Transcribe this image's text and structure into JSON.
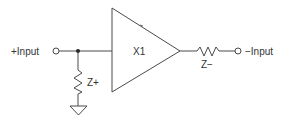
{
  "diagram": {
    "type": "circuit-schematic",
    "colors": {
      "line": "#4a4a4a",
      "text": "#333333",
      "background": "#ffffff"
    },
    "labels": {
      "plus_input": "+Input",
      "minus_input": "−Input",
      "amplifier": "X1",
      "z_plus": "Z+",
      "z_minus": "Z−"
    },
    "components": [
      {
        "id": "X1",
        "kind": "amplifier-triangle"
      },
      {
        "id": "Z+",
        "kind": "impedance",
        "connects": [
          "+Input node",
          "ground"
        ]
      },
      {
        "id": "Z-",
        "kind": "impedance",
        "connects": [
          "X1 output",
          "-Input terminal"
        ]
      }
    ],
    "terminals": [
      "+Input",
      "−Input"
    ],
    "nodes": [
      "junction",
      "ground"
    ]
  }
}
